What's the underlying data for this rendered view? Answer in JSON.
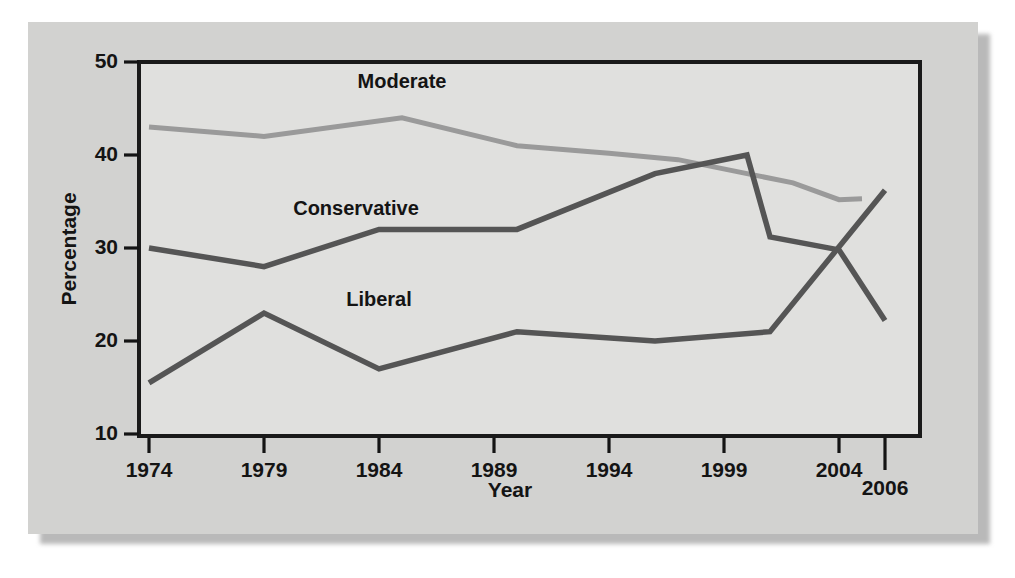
{
  "chart_data": {
    "type": "line",
    "title": "",
    "xlabel": "Year",
    "ylabel": "Percentage",
    "xlim": [
      1974,
      2006
    ],
    "ylim": [
      10,
      50
    ],
    "grid": false,
    "legend_position": "inline-labels",
    "xticks": [
      1974,
      1979,
      1984,
      1989,
      1994,
      1999,
      2004,
      2006
    ],
    "xtick_labels": [
      "1974",
      "1979",
      "1984",
      "1989",
      "1994",
      "1999",
      "2004",
      "2006"
    ],
    "yticks": [
      10,
      20,
      30,
      40,
      50
    ],
    "ytick_labels": [
      "10",
      "20",
      "30",
      "40",
      "50"
    ],
    "series": [
      {
        "name": "Moderate",
        "color": "#9a9a9a",
        "label_x": 1985,
        "label_y": 47.2,
        "x": [
          1974,
          1979,
          1985,
          1990,
          1994,
          1997,
          2000,
          2002,
          2004,
          2005
        ],
        "values": [
          43,
          42,
          44,
          41,
          40.2,
          39.5,
          38,
          37,
          35.2,
          35.3
        ]
      },
      {
        "name": "Conservative",
        "color": "#555555",
        "label_x": 1983,
        "label_y": 33.6,
        "x": [
          1974,
          1979,
          1984,
          1990,
          1996,
          2000,
          2001,
          2004,
          2006
        ],
        "values": [
          30,
          28,
          32,
          32,
          38,
          40,
          31.2,
          29.8,
          22.2
        ]
      },
      {
        "name": "Liberal",
        "color": "#555555",
        "label_x": 1984,
        "label_y": 23.8,
        "x": [
          1974,
          1979,
          1984,
          1990,
          1996,
          2001,
          2006
        ],
        "values": [
          15.5,
          23,
          17,
          21,
          20,
          21,
          36.2
        ]
      }
    ]
  },
  "colors": {
    "page_background": "#ffffff",
    "panel_background": "#d2d2d0",
    "plot_background": "#e0e0de",
    "axis": "#141414",
    "moderate": "#9a9a9a",
    "conservative": "#555555",
    "liberal": "#555555"
  }
}
